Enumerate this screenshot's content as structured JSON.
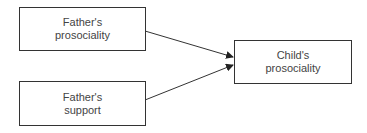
{
  "diagram": {
    "nodes": [
      {
        "id": "father-prosociality",
        "line1": "Father's",
        "line2": "prosociality"
      },
      {
        "id": "father-support",
        "line1": "Father's",
        "line2": "support"
      },
      {
        "id": "child-prosociality",
        "line1": "Child's",
        "line2": "prosociality"
      }
    ],
    "edges": [
      {
        "from": "father-prosociality",
        "to": "child-prosociality"
      },
      {
        "from": "father-support",
        "to": "child-prosociality"
      }
    ],
    "colors": {
      "stroke": "#333333",
      "text": "#444444"
    }
  }
}
